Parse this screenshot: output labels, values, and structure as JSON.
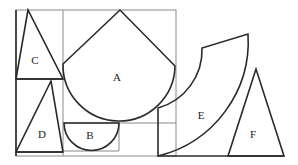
{
  "diagram": {
    "type": "geometric-puzzle-pieces",
    "colors": {
      "shape_stroke": "#2a2a2a",
      "frame_stroke": "#8a8a8a",
      "background": "#ffffff"
    },
    "shapes": [
      {
        "id": "A",
        "label": "A",
        "kind": "diamond-with-arc"
      },
      {
        "id": "B",
        "label": "B",
        "kind": "semicircle"
      },
      {
        "id": "C",
        "label": "C",
        "kind": "triangle"
      },
      {
        "id": "D",
        "label": "D",
        "kind": "triangle"
      },
      {
        "id": "E",
        "label": "E",
        "kind": "annular-sector"
      },
      {
        "id": "F",
        "label": "F",
        "kind": "triangle"
      }
    ]
  }
}
